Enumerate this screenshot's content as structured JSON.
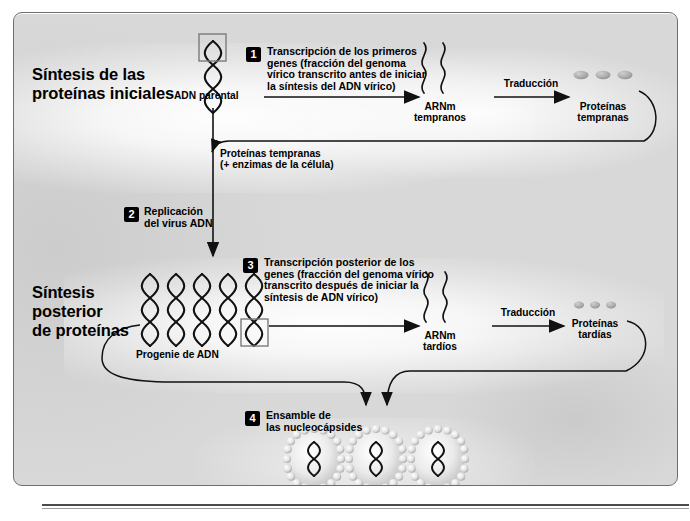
{
  "diagram": {
    "sections": [
      {
        "id": "early",
        "label": "Síntesis de las\nproteínas iniciales",
        "line1": "Síntesis de las",
        "line2": "proteínas iniciales"
      },
      {
        "id": "late",
        "label": "Síntesis posterior de proteínas",
        "line1": "Síntesis",
        "line2": "posterior",
        "line3": "de proteínas"
      }
    ],
    "steps": [
      {
        "number": "1",
        "text": "Transcripción de los primeros genes (fracción del genoma vírico transcrito antes de iniciar la síntesis del ADN vírico)",
        "lines": [
          "Transcripción de los primeros",
          "genes (fracción del genoma",
          "vírico transcrito antes de iniciar",
          "la síntesis del ADN vírico)"
        ]
      },
      {
        "number": "2",
        "text": "Replicación del virus ADN",
        "lines": [
          "Replicación",
          "del virus ADN"
        ]
      },
      {
        "number": "3",
        "text": "Transcripción posterior de los genes (fracción del genoma vírico transcrito después de iniciar la síntesis de ADN vírico)",
        "lines": [
          "Transcripción posterior de los",
          "genes (fracción del genoma vírico",
          "transcrito después de iniciar la",
          "síntesis de ADN vírico)"
        ]
      },
      {
        "number": "4",
        "text": "Ensamble de las nucleocápsides",
        "lines": [
          "Ensamble de",
          "las nucleocápsides"
        ]
      }
    ],
    "nodes": {
      "parental_dna": "ADN parental",
      "early_mrna_l1": "ARNm",
      "early_mrna_l2": "tempranos",
      "early_proteins_l1": "Proteínas",
      "early_proteins_l2": "tempranas",
      "progeny_dna": "Progenie de ADN",
      "late_mrna_l1": "ARNm",
      "late_mrna_l2": "tardíos",
      "late_proteins_l1": "Proteínas",
      "late_proteins_l2": "tardías"
    },
    "arrow_labels": {
      "translation_early": "Traducción",
      "translation_late": "Traducción",
      "feedback_l1": "Proteínas tempranas",
      "feedback_l2": "(+ enzimas de la célula)"
    },
    "counts": {
      "early_protein_dots": 3,
      "late_protein_dots": 3,
      "progeny_dna_helices": 5,
      "nucleocapsids": 3,
      "early_mrna_strands": 2,
      "late_mrna_strands": 2
    },
    "colors": {
      "panel_background": "#d8d8d8",
      "panel_border": "#6e6e6e",
      "text": "#000000",
      "badge_background": "#000000",
      "badge_text": "#ffffff",
      "stroke": "#1a1a1a",
      "capsid_bead": "#e8e8e8"
    }
  }
}
